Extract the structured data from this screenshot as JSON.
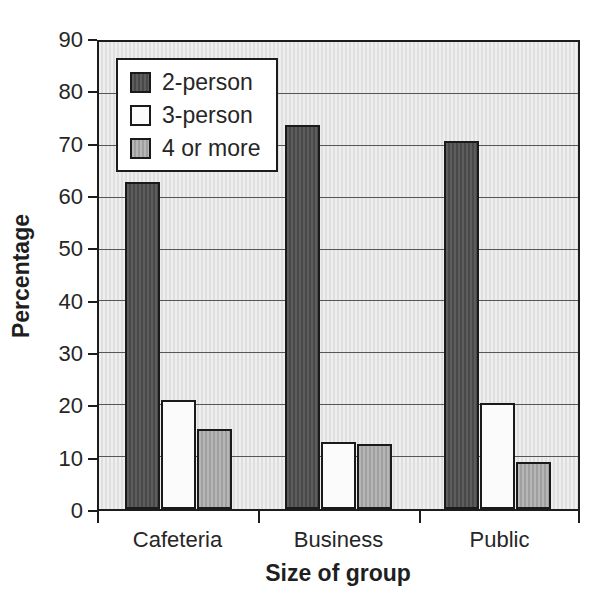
{
  "chart_data": {
    "type": "bar",
    "title": "",
    "xlabel": "Size of group",
    "ylabel": "Percentage",
    "categories": [
      "Cafeteria",
      "Business",
      "Public"
    ],
    "series": [
      {
        "name": "2-person",
        "color": "#515151",
        "values": [
          63,
          74,
          71
        ]
      },
      {
        "name": "3-person",
        "color": "#fbfbfb",
        "values": [
          21,
          13,
          20.5
        ]
      },
      {
        "name": "4 or more",
        "color": "#b1b1b1",
        "values": [
          15.5,
          12.5,
          9
        ]
      }
    ],
    "ylim": [
      0,
      90
    ],
    "yticks": [
      0,
      10,
      20,
      30,
      40,
      50,
      60,
      70,
      80,
      90
    ],
    "grid": "horizontal gridlines every 10",
    "legend_position": "top-left inside plot",
    "colors": {
      "plot_background": "#e6e6e6",
      "axis": "#1c1c1c",
      "gridline": "#565656",
      "text": "#262626"
    }
  }
}
